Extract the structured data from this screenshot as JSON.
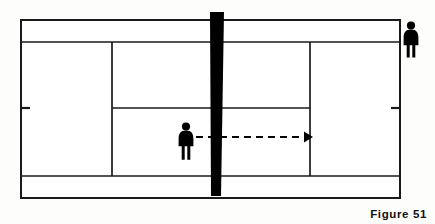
{
  "figure": {
    "caption_label": "Figure",
    "caption_number": "51",
    "background_color": "#fdfdfc",
    "line_color": "#1a1a1a",
    "net_color": "#000000",
    "player_color": "#000000",
    "arrow_color": "#000000"
  },
  "court": {
    "view": "overhead",
    "outer": {
      "x": 21,
      "y": 20,
      "width": 379,
      "height": 178
    },
    "lines": {
      "top_doubles_alley_y": 42,
      "bottom_doubles_alley_y": 176,
      "center_service_line_y": 108,
      "left_service_line_x": 112,
      "right_service_line_x": 310,
      "net_x": 216
    },
    "center_marks": [
      {
        "side": "left",
        "x": 21,
        "y": 108
      },
      {
        "side": "right",
        "x": 400,
        "y": 108
      }
    ]
  },
  "net": {
    "name": "net",
    "top_x_left": 210,
    "top_x_right": 224,
    "bottom_x_left": 211,
    "bottom_x_right": 221,
    "top_y": 12,
    "bottom_y": 196
  },
  "players": [
    {
      "id": "player-near-net",
      "label": "player at net",
      "x": 186,
      "y": 140,
      "scale": 1.0
    },
    {
      "id": "player-far-right",
      "label": "player at far baseline",
      "x": 411,
      "y": 38,
      "scale": 1.0
    }
  ],
  "arrow": {
    "name": "movement-arrow",
    "style": "dashed",
    "start_x": 196,
    "end_x": 312,
    "y": 137,
    "dash_pattern": "7,5",
    "direction": "right"
  }
}
